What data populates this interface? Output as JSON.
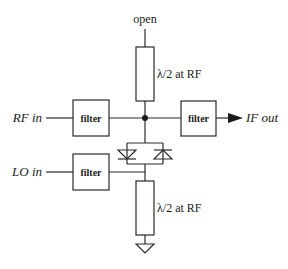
{
  "diagram": {
    "type": "circuit-schematic",
    "labels": {
      "open": "open",
      "top_stub": "λ/2 at RF",
      "bottom_stub": "λ/2 at RF",
      "rf_in": "RF in",
      "lo_in": "LO in",
      "if_out": "IF out"
    },
    "blocks": {
      "rf_filter": "filter",
      "if_filter": "filter",
      "lo_filter": "filter"
    },
    "components": {
      "diode_count": 2,
      "ground_symbol": "ground",
      "junction_dot": "node"
    },
    "colors": {
      "line": "#2a2a2a",
      "background": "#ffffff"
    }
  }
}
